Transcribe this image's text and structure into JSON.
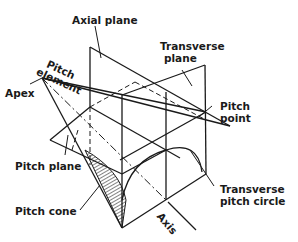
{
  "figure": {
    "type": "bevel gear geometry diagram",
    "labels": {
      "axial_plane": "Axial plane",
      "transverse_plane_line1": "Transverse",
      "transverse_plane_line2": "plane",
      "pitch_element_line1": "Pitch",
      "pitch_element_line2": "element",
      "apex": "Apex",
      "pitch_point_line1": "Pitch",
      "pitch_point_line2": "point",
      "pitch_plane": "Pitch plane",
      "pitch_cone": "Pitch cone",
      "transverse_pitch_circle_line1": "Transverse",
      "transverse_pitch_circle_line2": "pitch circle",
      "axis": "Axis"
    },
    "colors": {
      "ink": "#1a1a1a",
      "background": "#ffffff"
    }
  }
}
